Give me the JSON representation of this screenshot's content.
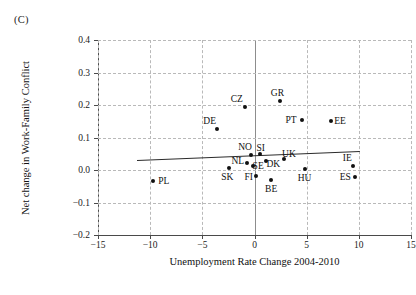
{
  "panel": {
    "label": "(C)"
  },
  "chart_data": {
    "type": "scatter",
    "title": "",
    "xlabel": "Unemployment Rate Change 2004-2010",
    "ylabel": "Net change in Work-Family Conflict",
    "xlim": [
      -15,
      15
    ],
    "ylim": [
      -0.2,
      0.4
    ],
    "xticks": [
      -15,
      -10,
      -5,
      0,
      5,
      10,
      15
    ],
    "xticklabels": [
      "−15",
      "−10",
      "−5",
      "0",
      "5",
      "10",
      "15"
    ],
    "yticks": [
      -0.2,
      -0.1,
      0.0,
      0.1,
      0.2,
      0.3,
      0.4
    ],
    "yticklabels": [
      "−0.2",
      "−0.1",
      "0.0",
      "0.1",
      "0.2",
      "0.3",
      "0.4"
    ],
    "grid": true,
    "legend": "none",
    "points": [
      {
        "label": "PL",
        "x": -9.7,
        "y": -0.035,
        "lx": -8.7,
        "ly": -0.035
      },
      {
        "label": "DE",
        "x": -3.6,
        "y": 0.125,
        "lx": -4.3,
        "ly": 0.152
      },
      {
        "label": "SK",
        "x": -2.4,
        "y": 0.005,
        "lx": -2.6,
        "ly": -0.022
      },
      {
        "label": "CZ",
        "x": -0.9,
        "y": 0.195,
        "lx": -1.7,
        "ly": 0.218
      },
      {
        "label": "NL",
        "x": -0.7,
        "y": 0.022,
        "lx": -1.6,
        "ly": 0.028
      },
      {
        "label": "NO",
        "x": -0.35,
        "y": 0.047,
        "lx": -0.9,
        "ly": 0.072
      },
      {
        "label": "SE",
        "x": -0.15,
        "y": 0.012,
        "lx": 0.35,
        "ly": 0.012
      },
      {
        "label": "FI",
        "x": 0.15,
        "y": -0.018,
        "lx": -0.55,
        "ly": -0.022
      },
      {
        "label": "SI",
        "x": 0.5,
        "y": 0.048,
        "lx": 0.6,
        "ly": 0.068
      },
      {
        "label": "DK",
        "x": 1.1,
        "y": 0.028,
        "lx": 1.8,
        "ly": 0.018
      },
      {
        "label": "BE",
        "x": 1.6,
        "y": -0.032,
        "lx": 1.6,
        "ly": -0.058
      },
      {
        "label": "GR",
        "x": 2.4,
        "y": 0.212,
        "lx": 2.2,
        "ly": 0.238
      },
      {
        "label": "UK",
        "x": 2.8,
        "y": 0.035,
        "lx": 3.3,
        "ly": 0.048
      },
      {
        "label": "PT",
        "x": 4.6,
        "y": 0.155,
        "lx": 3.5,
        "ly": 0.155
      },
      {
        "label": "HU",
        "x": 4.8,
        "y": 0.002,
        "lx": 4.8,
        "ly": -0.024
      },
      {
        "label": "EE",
        "x": 7.3,
        "y": 0.152,
        "lx": 8.2,
        "ly": 0.152
      },
      {
        "label": "ES",
        "x": 9.6,
        "y": -0.022,
        "lx": 8.7,
        "ly": -0.022
      },
      {
        "label": "IE",
        "x": 9.4,
        "y": 0.012,
        "lx": 8.9,
        "ly": 0.038
      }
    ],
    "trendline": {
      "x0": -11.3,
      "y0": 0.03,
      "x1": 10.1,
      "y1": 0.058
    }
  }
}
